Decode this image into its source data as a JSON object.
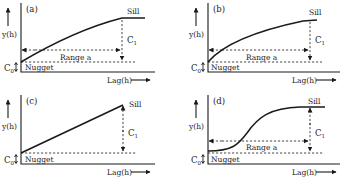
{
  "figure": {
    "panels": [
      {
        "id": "a",
        "label": "(a)",
        "sill_label": "Sill",
        "c1_label": "C",
        "c1_sub": "1",
        "c0_label": "C",
        "c0_sub": "0",
        "nugget_label": "Nugget",
        "range_label": "Range a",
        "y_label": "y(h)",
        "x_label": "Lag(h)",
        "model": "spherical"
      },
      {
        "id": "b",
        "label": "(b)",
        "sill_label": "Sill",
        "c1_label": "C",
        "c1_sub": "1",
        "c0_label": "C",
        "c0_sub": "0",
        "nugget_label": "Nugget",
        "range_label": "Range a",
        "y_label": "y(h)",
        "x_label": "Lag(h)",
        "model": "exponential"
      },
      {
        "id": "c",
        "label": "(c)",
        "sill_label": "Sill",
        "c1_label": "C",
        "c1_sub": "1",
        "c0_label": "C",
        "c0_sub": "0",
        "nugget_label": "Nugget",
        "y_label": "y(h)",
        "x_label": "Lag(h)",
        "model": "linear"
      },
      {
        "id": "d",
        "label": "(d)",
        "sill_label": "Sill",
        "c1_label": "C",
        "c1_sub": "1",
        "c0_label": "C",
        "c0_sub": "0",
        "nugget_label": "Nugget",
        "range_label": "Range a",
        "y_label": "y(h)",
        "x_label": "Lag(h)",
        "model": "gaussian"
      }
    ]
  }
}
